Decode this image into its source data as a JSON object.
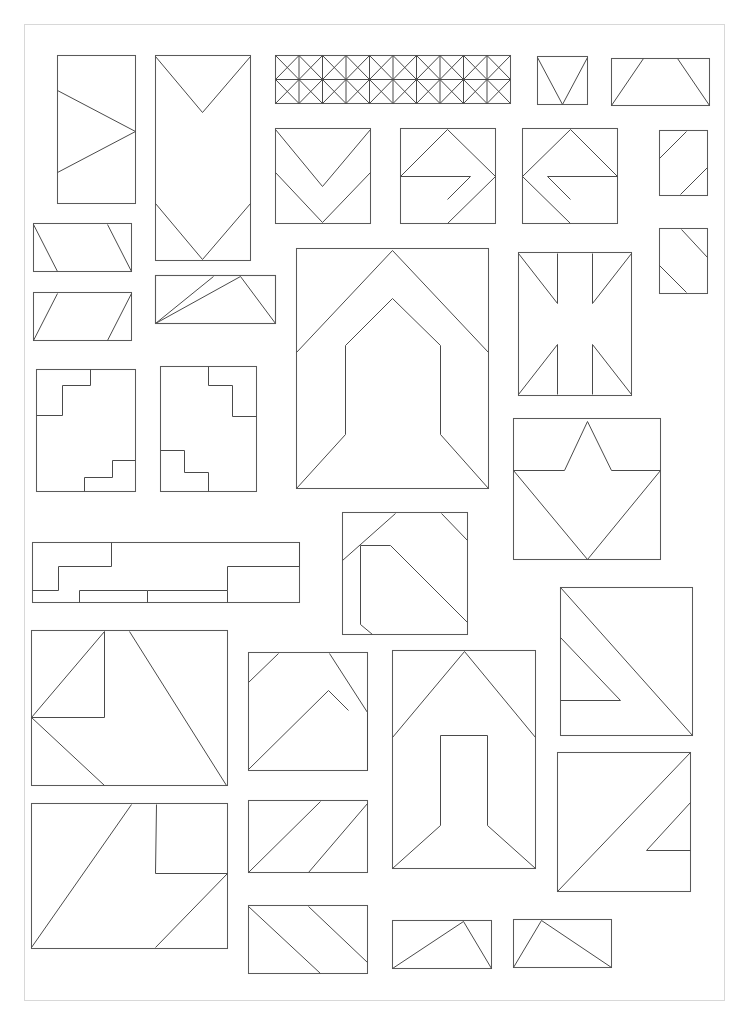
{
  "document": {
    "title": "Geometric Line Drawing Sheet",
    "kind": "technical-line-drawing-collage",
    "canvas": {
      "width": 748,
      "height": 1024,
      "background": "#ffffff"
    },
    "page_border": {
      "x": 24,
      "y": 24,
      "width": 700,
      "height": 976,
      "color": "#d8d8d8"
    },
    "stroke": {
      "outline_color": "#5a5a5a",
      "inner_color": "#4a4a4a",
      "outline_width": 1.05,
      "inner_width": 1.0
    },
    "figure_count": 33
  },
  "figures": [
    {
      "id": "fig-01",
      "name": "tall-rect-zigzag-arrow-left",
      "row": 1,
      "box": {
        "x": 57,
        "y": 55,
        "width": 78,
        "height": 148
      },
      "inner_paths": [
        "M 57,90 L 135,131 L 57,172"
      ]
    },
    {
      "id": "fig-02",
      "name": "tall-rect-double-chevron-down",
      "row": 1,
      "box": {
        "x": 155,
        "y": 55,
        "width": 95,
        "height": 205
      },
      "inner_paths": [
        "M 155,56 L 202,112 L 250,56",
        "M 155,203 L 202,259 L 250,203"
      ]
    },
    {
      "id": "fig-03",
      "name": "wide-truss-band-x-lattice",
      "row": 1,
      "box": {
        "x": 275,
        "y": 55,
        "width": 235,
        "height": 48
      },
      "lattice": {
        "bays": 5,
        "has_midline": true,
        "has_verticals": true,
        "has_diagonals": true
      }
    },
    {
      "id": "fig-04",
      "name": "small-square-v-notch",
      "row": 1,
      "box": {
        "x": 537,
        "y": 56,
        "width": 50,
        "height": 48
      },
      "inner_paths": [
        "M 537,57 L 562,104 L 587,57"
      ]
    },
    {
      "id": "fig-05",
      "name": "wide-rect-trapezoid-slants",
      "row": 1,
      "box": {
        "x": 611,
        "y": 58,
        "width": 98,
        "height": 47
      },
      "inner_paths": [
        "M 611,105 L 643,58",
        "M 709,105 L 677,58"
      ]
    },
    {
      "id": "fig-06",
      "name": "square-chevron-double-down",
      "row": 2,
      "box": {
        "x": 275,
        "y": 128,
        "width": 95,
        "height": 95
      },
      "inner_paths": [
        "M 275,129 L 322,186 L 370,129",
        "M 275,172 L 322,222 L 370,172"
      ]
    },
    {
      "id": "fig-07",
      "name": "square-arrow-right-outline",
      "row": 2,
      "box": {
        "x": 400,
        "y": 128,
        "width": 95,
        "height": 95
      },
      "inner_paths": [
        "M 400,176 L 447,129 L 495,176 L 447,223",
        "M 400,176 L 470,176 L 447,199"
      ]
    },
    {
      "id": "fig-08",
      "name": "square-arrow-left-outline",
      "row": 2,
      "box": {
        "x": 522,
        "y": 128,
        "width": 95,
        "height": 95
      },
      "inner_paths": [
        "M 617,176 L 570,129 L 522,176 L 570,223",
        "M 617,176 L 547,176 L 570,199"
      ]
    },
    {
      "id": "fig-09",
      "name": "small-rect-two-corner-slants-a",
      "row": 2,
      "box": {
        "x": 659,
        "y": 130,
        "width": 48,
        "height": 65
      },
      "inner_paths": [
        "M 659,158 L 686,131",
        "M 707,167 L 680,194"
      ]
    },
    {
      "id": "fig-10",
      "name": "small-rect-two-corner-slants-b",
      "row": 2,
      "box": {
        "x": 659,
        "y": 228,
        "width": 48,
        "height": 65
      },
      "inner_paths": [
        "M 681,229 L 707,257",
        "M 659,265 L 686,292"
      ]
    },
    {
      "id": "fig-11",
      "name": "wide-rect-parallelogram-a",
      "row": 3,
      "box": {
        "x": 33,
        "y": 223,
        "width": 98,
        "height": 48
      },
      "inner_paths": [
        "M 33,224 L 57,271",
        "M 131,271 L 107,224"
      ]
    },
    {
      "id": "fig-12",
      "name": "wide-rect-parallelogram-b",
      "row": 3,
      "box": {
        "x": 33,
        "y": 292,
        "width": 98,
        "height": 48
      },
      "inner_paths": [
        "M 33,340 L 57,293",
        "M 131,293 L 107,340"
      ]
    },
    {
      "id": "fig-13",
      "name": "wide-rect-double-triangle",
      "row": 3,
      "box": {
        "x": 155,
        "y": 275,
        "width": 120,
        "height": 48
      },
      "inner_paths": [
        "M 155,323 L 213,276",
        "M 275,323 L 240,276 L 155,323"
      ]
    },
    {
      "id": "fig-14",
      "name": "large-square-nested-arrowhead-house",
      "row": 3,
      "box": {
        "x": 296,
        "y": 248,
        "width": 192,
        "height": 240
      },
      "inner_paths": [
        "M 296,352 L 392,250 L 488,352",
        "M 296,488 L 345,434 L 345,345 L 392,298 L 440,345 L 440,434 L 488,488"
      ]
    },
    {
      "id": "fig-15",
      "name": "square-union-jack-cross",
      "row": 3,
      "box": {
        "x": 518,
        "y": 252,
        "width": 113,
        "height": 143
      },
      "inner_paths": [
        "M 518,253 L 557,303 L 557,253",
        "M 631,253 L 592,303 L 592,253",
        "M 518,394 L 557,344 L 557,394",
        "M 631,394 L 592,344 L 592,394"
      ]
    },
    {
      "id": "fig-16",
      "name": "rect-stepped-corners-a",
      "row": 4,
      "box": {
        "x": 36,
        "y": 369,
        "width": 99,
        "height": 122
      },
      "inner_paths": [
        "M 90,369 L 90,385 L 62,385 L 62,415 L 36,415",
        "M 135,460 L 112,460 L 112,477 L 84,477 L 84,491"
      ]
    },
    {
      "id": "fig-17",
      "name": "rect-stepped-corners-b",
      "row": 4,
      "box": {
        "x": 160,
        "y": 366,
        "width": 96,
        "height": 125
      },
      "inner_paths": [
        "M 208,366 L 208,385 L 232,385 L 232,416 L 256,416",
        "M 160,450 L 184,450 L 184,472 L 208,472 L 208,491"
      ]
    },
    {
      "id": "fig-18",
      "name": "wide-stepped-plateau-strip",
      "row": 5,
      "box": {
        "x": 32,
        "y": 542,
        "width": 267,
        "height": 60
      },
      "inner_paths": [
        "M 111,542 L 111,566 L 58,566 L 58,590 L 32,590",
        "M 299,542 L 299,566 L 227,566 L 227,590 L 147,590",
        "M 79,602 L 79,590 L 147,590 L 147,602",
        "M 227,590 L 227,602"
      ]
    },
    {
      "id": "fig-19",
      "name": "square-corner-bands-diagonal",
      "row": 5,
      "box": {
        "x": 342,
        "y": 512,
        "width": 125,
        "height": 122
      },
      "inner_paths": [
        "M 342,560 L 395,513",
        "M 372,634 L 360,624 L 360,545 L 390,545 L 467,622",
        "M 441,513 L 467,540"
      ]
    },
    {
      "id": "fig-20",
      "name": "square-star-crown",
      "row": 5,
      "box": {
        "x": 513,
        "y": 418,
        "width": 147,
        "height": 141
      },
      "inner_paths": [
        "M 513,470 L 564,470 L 587,421 L 611,470 L 660,470",
        "M 513,470 L 587,559 L 660,470"
      ]
    },
    {
      "id": "fig-21",
      "name": "wide-rect-zigzag-double-slant",
      "row": 6,
      "box": {
        "x": 31,
        "y": 630,
        "width": 196,
        "height": 155
      },
      "inner_paths": [
        "M 31,717 L 104,631 L 104,717 L 31,717",
        "M 31,717 L 104,785",
        "M 226,785 L 129,631"
      ]
    },
    {
      "id": "fig-22",
      "name": "square-corner-bands-right-diagonal",
      "row": 6,
      "box": {
        "x": 248,
        "y": 652,
        "width": 119,
        "height": 118
      },
      "inner_paths": [
        "M 248,682 L 278,653",
        "M 248,769 L 328,690 L 348,710",
        "M 367,712 L 329,653",
        "M 367,712 L 367,770"
      ]
    },
    {
      "id": "fig-23",
      "name": "tall-square-peak-with-column",
      "row": 6,
      "box": {
        "x": 392,
        "y": 650,
        "width": 143,
        "height": 218
      },
      "inner_paths": [
        "M 392,737 L 464,651 L 535,737",
        "M 392,868 L 440,825 L 440,735 L 487,735 L 487,825 L 535,868"
      ]
    },
    {
      "id": "fig-24",
      "name": "square-nested-arrow-left-to-diagonal",
      "row": 6,
      "box": {
        "x": 560,
        "y": 587,
        "width": 132,
        "height": 148
      },
      "inner_paths": [
        "M 560,587 L 692,735",
        "M 560,637 L 620,700 L 560,700"
      ]
    },
    {
      "id": "fig-25",
      "name": "wide-rect-two-parallel-slants-a",
      "row": 7,
      "box": {
        "x": 248,
        "y": 800,
        "width": 119,
        "height": 72
      },
      "inner_paths": [
        "M 248,872 L 320,801",
        "M 308,872 L 367,803"
      ]
    },
    {
      "id": "fig-26",
      "name": "wide-rect-zigzag-stepped-slants",
      "row": 7,
      "box": {
        "x": 31,
        "y": 803,
        "width": 196,
        "height": 145
      },
      "inner_paths": [
        "M 31,947 L 131,804",
        "M 156,804 L 155,873 L 227,873",
        "M 227,873 L 155,947"
      ]
    },
    {
      "id": "fig-27",
      "name": "square-nested-arrow-right-to-diagonal",
      "row": 7,
      "box": {
        "x": 557,
        "y": 752,
        "width": 133,
        "height": 139
      },
      "inner_paths": [
        "M 557,891 L 690,752",
        "M 690,802 L 646,850 L 690,850"
      ]
    },
    {
      "id": "fig-28",
      "name": "wide-rect-two-parallel-slants-b",
      "row": 8,
      "box": {
        "x": 248,
        "y": 905,
        "width": 119,
        "height": 68
      },
      "inner_paths": [
        "M 248,906 L 320,973",
        "M 308,906 L 367,962"
      ]
    },
    {
      "id": "fig-29",
      "name": "small-rect-triangle-right-apex",
      "row": 8,
      "box": {
        "x": 392,
        "y": 920,
        "width": 99,
        "height": 48
      },
      "inner_paths": [
        "M 392,968 L 463,921 L 491,968"
      ]
    },
    {
      "id": "fig-30",
      "name": "small-rect-triangle-left-apex",
      "row": 8,
      "box": {
        "x": 513,
        "y": 919,
        "width": 98,
        "height": 48
      },
      "inner_paths": [
        "M 513,967 L 541,920 L 611,967"
      ]
    },
    {
      "id": "fig-31",
      "name": "wide-rect-double-triangle-lower",
      "row": 3,
      "box": {
        "x": 155,
        "y": 275,
        "width": 120,
        "height": 48
      },
      "inner_paths": []
    }
  ],
  "legend": {
    "description": "Black-and-white hand-drafted sheet of 30+ rectangular panels, each containing straight-line geometric subdivisions: chevrons, arrowheads, parallelograms, stepped zigzags, a truss lattice band, a union-jack cross and a star/crown motif.",
    "palette": {
      "background": "#ffffff",
      "line": "#5a5a5a",
      "page_border": "#d8d8d8"
    }
  }
}
